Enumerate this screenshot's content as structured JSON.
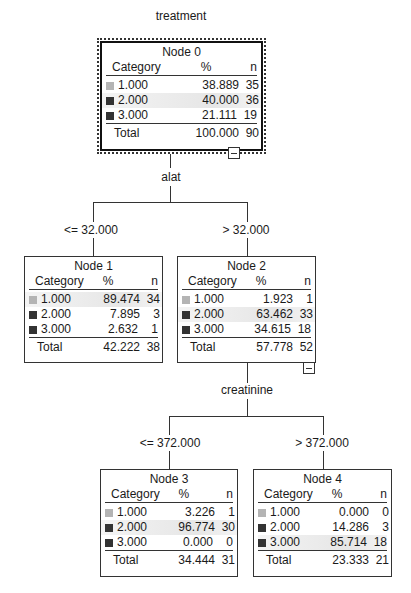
{
  "tree": {
    "target": "treatment",
    "headers": {
      "category": "Category",
      "percent": "%",
      "n": "n"
    },
    "total_label": "Total",
    "colors": {
      "cat1": "#b4b4b4",
      "cat2": "#333333",
      "cat3": "#333333",
      "highlight": "#e8e8e8"
    },
    "nodes": [
      {
        "title": "Node 0",
        "rows": [
          {
            "cat": "1.000",
            "pct": "38.889",
            "n": "35"
          },
          {
            "cat": "2.000",
            "pct": "40.000",
            "n": "36"
          },
          {
            "cat": "3.000",
            "pct": "21.111",
            "n": "19"
          }
        ],
        "total_pct": "100.000",
        "total_n": "90",
        "modal": 1
      },
      {
        "title": "Node 1",
        "rows": [
          {
            "cat": "1.000",
            "pct": "89.474",
            "n": "34"
          },
          {
            "cat": "2.000",
            "pct": "7.895",
            "n": "3"
          },
          {
            "cat": "3.000",
            "pct": "2.632",
            "n": "1"
          }
        ],
        "total_pct": "42.222",
        "total_n": "38",
        "modal": 0
      },
      {
        "title": "Node 2",
        "rows": [
          {
            "cat": "1.000",
            "pct": "1.923",
            "n": "1"
          },
          {
            "cat": "2.000",
            "pct": "63.462",
            "n": "33"
          },
          {
            "cat": "3.000",
            "pct": "34.615",
            "n": "18"
          }
        ],
        "total_pct": "57.778",
        "total_n": "52",
        "modal": 1
      },
      {
        "title": "Node 3",
        "rows": [
          {
            "cat": "1.000",
            "pct": "3.226",
            "n": "1"
          },
          {
            "cat": "2.000",
            "pct": "96.774",
            "n": "30"
          },
          {
            "cat": "3.000",
            "pct": "0.000",
            "n": "0"
          }
        ],
        "total_pct": "34.444",
        "total_n": "31",
        "modal": 1
      },
      {
        "title": "Node 4",
        "rows": [
          {
            "cat": "1.000",
            "pct": "0.000",
            "n": "0"
          },
          {
            "cat": "2.000",
            "pct": "14.286",
            "n": "3"
          },
          {
            "cat": "3.000",
            "pct": "85.714",
            "n": "18"
          }
        ],
        "total_pct": "23.333",
        "total_n": "21",
        "modal": 2
      }
    ],
    "splits": [
      {
        "variable": "alat",
        "left": "<= 32.000",
        "right": "> 32.000"
      },
      {
        "variable": "creatinine",
        "left": "<= 372.000",
        "right": "> 372.000"
      }
    ]
  }
}
